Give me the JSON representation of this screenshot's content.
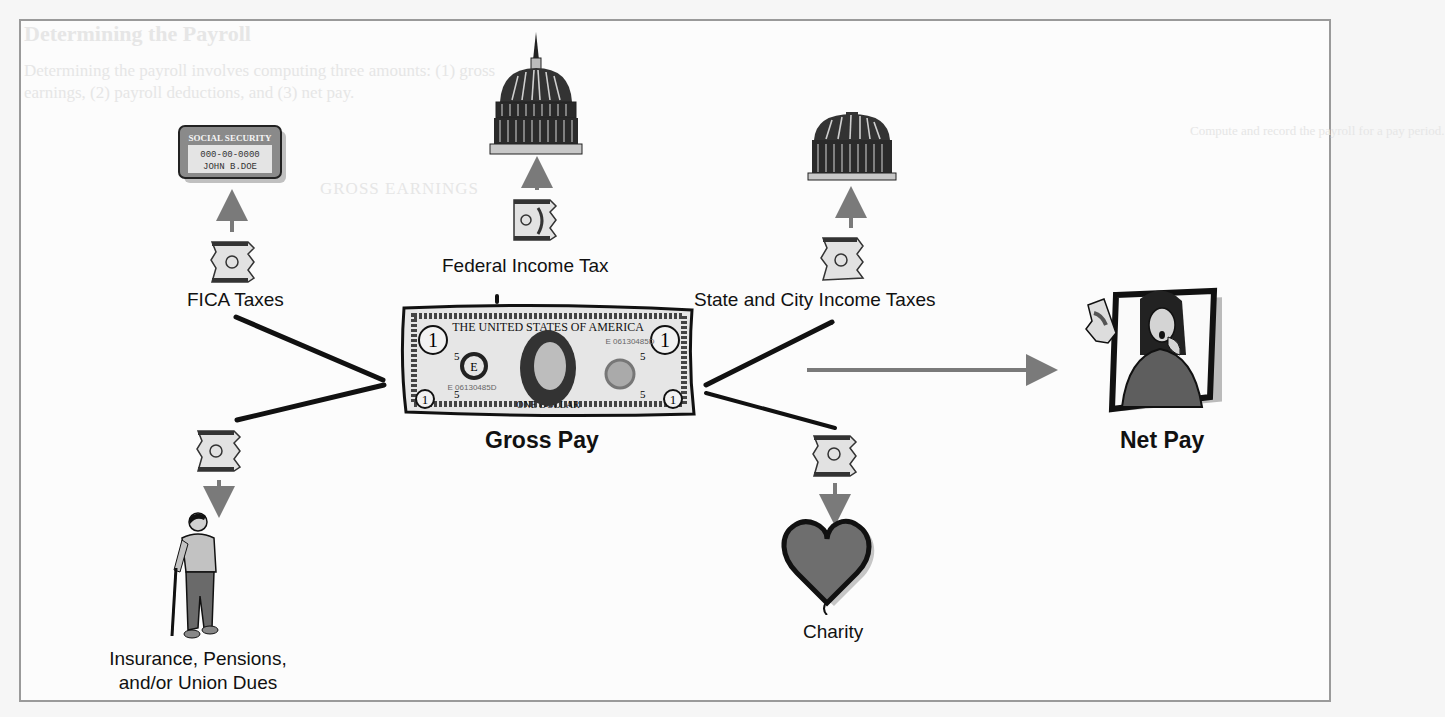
{
  "diagram": {
    "center": {
      "label": "Gross Pay",
      "icon": "dollar-bill-icon",
      "bill_text": {
        "top": "THE UNITED STATES OF AMERICA",
        "bottom": "ONE DOLLAR",
        "serial": "E 06130485D",
        "seal_letter": "E",
        "corner": "1",
        "denomination_small": "5"
      }
    },
    "result": {
      "label": "Net Pay",
      "icon": "woman-holding-money-icon"
    },
    "deductions": [
      {
        "id": "fica",
        "label": "FICA Taxes",
        "destination_icon": "social-security-card-icon",
        "card": {
          "header": "SOCIAL SECURITY",
          "number": "000-00-0000",
          "name": "JOHN B.DOE"
        }
      },
      {
        "id": "federal",
        "label": "Federal Income Tax",
        "destination_icon": "capitol-dome-icon"
      },
      {
        "id": "state-city",
        "label": "State and City Income Taxes",
        "destination_icon": "small-dome-icon"
      },
      {
        "id": "insurance",
        "label_line1": "Insurance, Pensions,",
        "label_line2": "and/or Union Dues",
        "destination_icon": "elderly-man-with-cane-icon"
      },
      {
        "id": "charity",
        "label": "Charity",
        "destination_icon": "heart-icon"
      }
    ],
    "colors": {
      "arrow": "#7a7a7a",
      "spoke": "#111111",
      "frame_border": "#9a9a9a",
      "heart_fill": "#6e6e6e",
      "woman_fill": "#5e5e5e"
    }
  },
  "background_bleed": {
    "heading": "Determining the Payroll",
    "line1": "Determining the payroll involves computing three amounts: (1) gross",
    "line2": "earnings, (2) payroll deductions, and (3) net pay.",
    "subheading": "GROSS EARNINGS",
    "side_note": "Compute and record the payroll for a pay period."
  }
}
